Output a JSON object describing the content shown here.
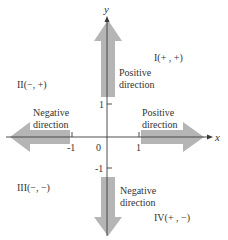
{
  "diagram": {
    "type": "coordinate-plane",
    "axes": {
      "x_label": "x",
      "y_label": "y",
      "origin_label": "0",
      "x_ticks": [
        "-1",
        "1"
      ],
      "y_ticks": [
        "1",
        "-1"
      ]
    },
    "quadrants": [
      {
        "label": "I(+ ,  +)"
      },
      {
        "label": "II(−,  +)"
      },
      {
        "label": "III(−,  −)"
      },
      {
        "label": "IV(+ ,  −)"
      }
    ],
    "arrows": {
      "up": {
        "line1": "Positive",
        "line2": "direction"
      },
      "right": {
        "line1": "Positive",
        "line2": "direction"
      },
      "left": {
        "line1": "Negative",
        "line2": "direction"
      },
      "down": {
        "line1": "Negative",
        "line2": "direction"
      }
    },
    "colors": {
      "arrow_fill": "#b3b3b3",
      "axis": "#3a3a3a",
      "text": "#333333"
    }
  }
}
